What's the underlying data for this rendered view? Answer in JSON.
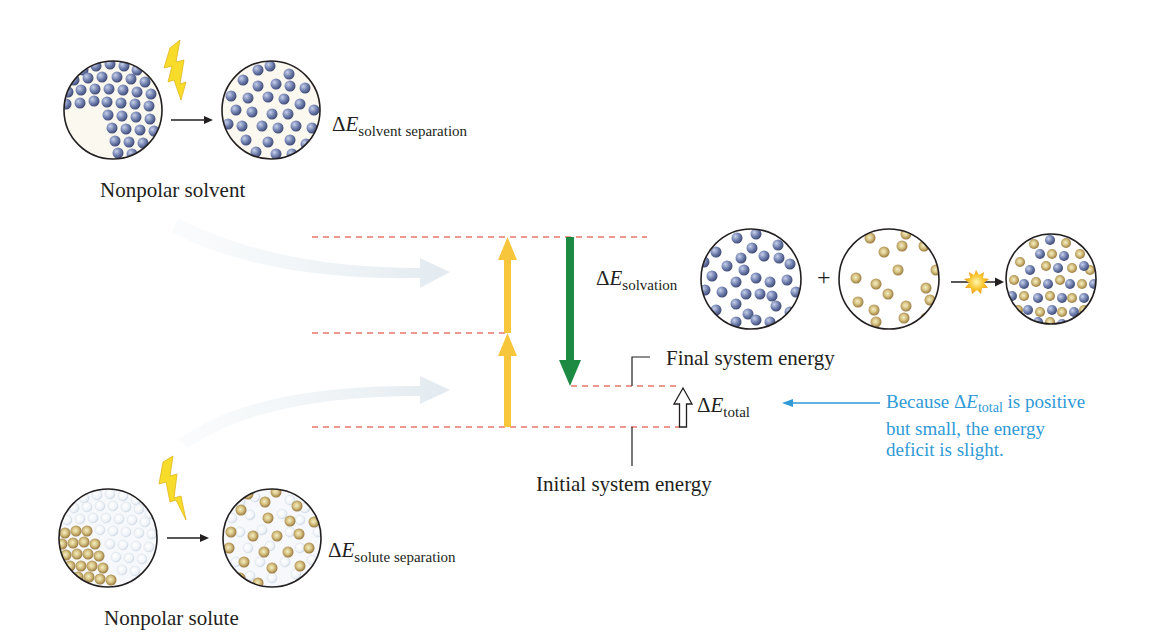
{
  "labels": {
    "solvent_caption": "Nonpolar solvent",
    "solute_caption": "Nonpolar solute",
    "final_energy": "Final system energy",
    "initial_energy": "Initial system energy",
    "plus": "+"
  },
  "energy_terms": {
    "solvent_separation": {
      "delta": "Δ",
      "var": "E",
      "sub": "solvent separation"
    },
    "solute_separation": {
      "delta": "Δ",
      "var": "E",
      "sub": "solute separation"
    },
    "solvation": {
      "delta": "Δ",
      "var": "E",
      "sub": "solvation"
    },
    "total": {
      "delta": "Δ",
      "var": "E",
      "sub": "total"
    }
  },
  "note": {
    "pre": "Because ",
    "delta": "Δ",
    "var": "E",
    "sub": "total",
    "post": " is positive but small, the energy deficit is slight."
  },
  "colors": {
    "solvent_particle": "#6f7fae",
    "solute_particle": "#b59a5e",
    "yellow_arrow": "#f7c63b",
    "green_arrow": "#1d8a43",
    "dashed_line": "#e8776a",
    "note_text": "#2f9ad6",
    "flow_arrow": "#e6eef3"
  },
  "icons": {
    "energy_input": "lightning-bolt-icon",
    "mixing": "starburst-icon"
  }
}
